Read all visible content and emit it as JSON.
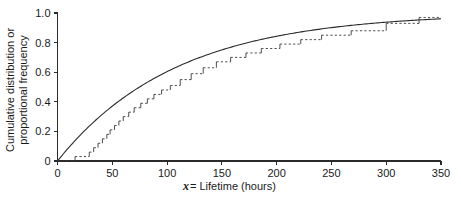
{
  "chart_data": {
    "type": "line",
    "title": "",
    "xlabel_prefix": "x",
    "xlabel_rest": " = Lifetime (hours)",
    "xlabel": "x = Lifetime (hours)",
    "ylabel_line1": "Cumulative distribution or",
    "ylabel_line2": "proportional frequency",
    "ylabel": "Cumulative distribution or proportional frequency",
    "xlim": [
      0,
      350
    ],
    "ylim": [
      0,
      1.0
    ],
    "xticks": [
      0,
      50,
      100,
      150,
      200,
      250,
      300,
      350
    ],
    "xtick_labels": [
      "0",
      "50",
      "100",
      "150",
      "200",
      "250",
      "300",
      "350"
    ],
    "yticks": [
      0,
      0.2,
      0.4,
      0.6,
      0.8,
      1.0
    ],
    "ytick_labels": [
      "0",
      "0.2",
      "0.4",
      "0.6",
      "0.8",
      "1.0"
    ],
    "grid": false,
    "legend": "none",
    "series": [
      {
        "name": "Fitted exponential cumulative distribution",
        "style": "solid-smooth",
        "color": "#2b2b2b",
        "model": "F(x) = 1 - exp(-x/tau)",
        "tau": 108,
        "x": [
          0,
          10,
          20,
          30,
          40,
          50,
          60,
          70,
          80,
          90,
          100,
          120,
          140,
          160,
          180,
          200,
          220,
          240,
          260,
          280,
          300,
          320,
          340,
          350
        ],
        "y": [
          0.0,
          0.088,
          0.169,
          0.242,
          0.31,
          0.371,
          0.427,
          0.477,
          0.523,
          0.565,
          0.603,
          0.67,
          0.725,
          0.772,
          0.81,
          0.842,
          0.87,
          0.892,
          0.911,
          0.927,
          0.94,
          0.951,
          0.959,
          0.963
        ]
      },
      {
        "name": "Empirical cumulative step function",
        "style": "step-dashed-tread",
        "color": "#3a3a3a",
        "x": [
          0,
          16,
          29,
          33,
          37,
          41,
          45,
          48,
          52,
          56,
          60,
          65,
          70,
          76,
          82,
          88,
          95,
          103,
          112,
          122,
          133,
          145,
          158,
          172,
          186,
          203,
          222,
          241,
          268,
          300,
          330
        ],
        "y": [
          0.0,
          0.03,
          0.06,
          0.09,
          0.12,
          0.15,
          0.18,
          0.21,
          0.24,
          0.27,
          0.3,
          0.33,
          0.36,
          0.39,
          0.42,
          0.45,
          0.48,
          0.51,
          0.55,
          0.59,
          0.63,
          0.67,
          0.7,
          0.73,
          0.76,
          0.79,
          0.82,
          0.85,
          0.88,
          0.93,
          0.97
        ]
      }
    ]
  }
}
